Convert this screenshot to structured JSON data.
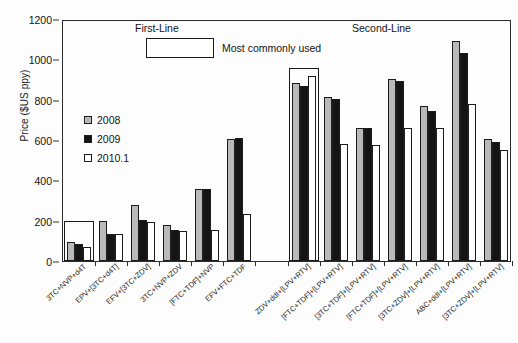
{
  "chart_data": {
    "type": "bar",
    "title": "",
    "xlabel": "",
    "ylabel": "Price ($US ppy)",
    "ylim": [
      0,
      1200
    ],
    "yticks": [
      0,
      200,
      400,
      600,
      800,
      1000,
      1200
    ],
    "grid": false,
    "legend_position": "inside-upper-left",
    "annotations": [
      {
        "text": "First-Line",
        "role": "group-annotation"
      },
      {
        "text": "Second-Line",
        "role": "group-annotation"
      },
      {
        "text": "Most commonly used",
        "role": "box-legend-label"
      }
    ],
    "series": [
      {
        "name": "2008",
        "color": "#b9b9b9",
        "values": [
          95,
          198,
          278,
          178,
          355,
          605,
          null,
          885,
          815,
          660,
          905,
          770,
          1090,
          605
        ]
      },
      {
        "name": "2009",
        "color": "#141414",
        "values": [
          85,
          135,
          203,
          155,
          358,
          608,
          null,
          870,
          805,
          660,
          895,
          745,
          1030,
          588
        ]
      },
      {
        "name": "2010.1",
        "color": "#ffffff",
        "values": [
          68,
          135,
          193,
          148,
          155,
          233,
          null,
          915,
          580,
          575,
          660,
          660,
          780,
          550
        ]
      }
    ],
    "categories": [
      "3TC+NVP+d4T",
      "EPV+[3TC+d4T]",
      "EFV+[3TC+ZDV]",
      "3TC+NVP+ZDV",
      "[FTC+TDF]+NVP",
      "EFV+FTC+TDF",
      "",
      "ZDV+ddI+[LPV+RTV]",
      "[FTC+TDF]+[LPV+RTV]",
      "[3TC+TDF]+[LPV+RTV]",
      "[FTC+TDF]+[LPV+RTV]",
      "[3TC+ZDV]+[LPV+RTV]",
      "ABC+ddI+[LPV+RTV]",
      "[3TC+ZDV]+[LPV+RTV]"
    ],
    "highlighted_categories": [
      "3TC+NVP+d4T",
      "ZDV+ddI+[LPV+RTV]"
    ],
    "groups": [
      {
        "label": "First-Line",
        "category_indices": [
          0,
          1,
          2,
          3,
          4,
          5
        ]
      },
      {
        "label": "Second-Line",
        "category_indices": [
          7,
          8,
          9,
          10,
          11,
          12,
          13
        ]
      }
    ]
  },
  "yaxis": {
    "title": "Price ($US ppy)",
    "ticks": [
      "1200",
      "1000",
      "800",
      "600",
      "400",
      "200",
      "0"
    ]
  },
  "annotations": {
    "first_line": "First-Line",
    "second_line": "Second-Line",
    "most_commonly_used": "Most commonly used"
  },
  "legend": {
    "items": [
      {
        "label": "2008",
        "key": "y2008"
      },
      {
        "label": "2009",
        "key": "y2009"
      },
      {
        "label": "2010.1",
        "key": "y2010"
      }
    ]
  }
}
